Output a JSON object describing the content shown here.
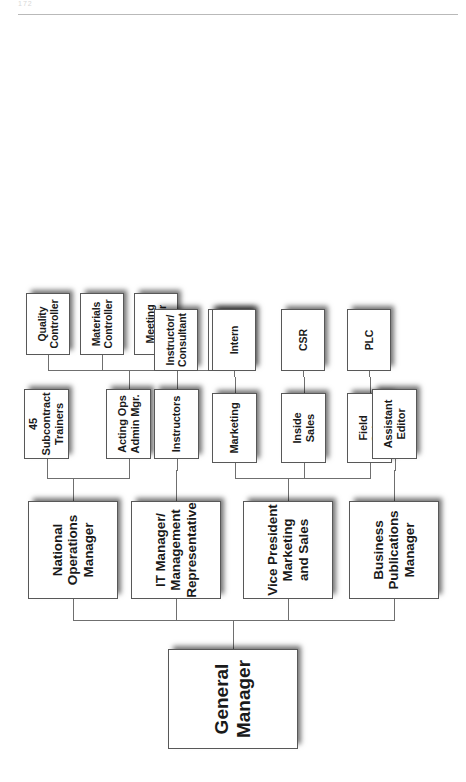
{
  "page": {
    "folio": "172",
    "header_rule": true
  },
  "chart": {
    "orientation": "rotated-90-ccw",
    "root": {
      "id": "general-manager",
      "label": "General Manager"
    },
    "level2": [
      {
        "id": "national-operations-manager",
        "label": "National\nOperations\nManager"
      },
      {
        "id": "it-manager-management-representative",
        "label": "IT Manager/\nManagement\nRepresentative"
      },
      {
        "id": "vice-president-marketing-and-sales",
        "label": "Vice President\nMarketing\nand Sales"
      },
      {
        "id": "business-publications-manager",
        "label": "Business\nPublications\nManager"
      }
    ],
    "level3": [
      {
        "id": "subcontract-trainers",
        "label": "45\nSubcontract\nTrainers",
        "parent": "national-operations-manager"
      },
      {
        "id": "acting-ops-admin-mgr",
        "label": "Acting Ops\nAdmin Mgr.",
        "parent": "national-operations-manager"
      },
      {
        "id": "instructors",
        "label": "Instructors",
        "parent": "it-manager-management-representative"
      },
      {
        "id": "marketing",
        "label": "Marketing",
        "parent": "vice-president-marketing-and-sales"
      },
      {
        "id": "inside-sales",
        "label": "Inside\nSales",
        "parent": "vice-president-marketing-and-sales"
      },
      {
        "id": "field-sales",
        "label": "Field\nSales",
        "parent": "vice-president-marketing-and-sales"
      },
      {
        "id": "assistant-editor",
        "label": "Assistant\nEditor",
        "parent": "business-publications-manager"
      }
    ],
    "level4": [
      {
        "id": "quality-controller",
        "label": "Quality\nController",
        "parent": "acting-ops-admin-mgr"
      },
      {
        "id": "materials-controller",
        "label": "Materials\nController",
        "parent": "acting-ops-admin-mgr"
      },
      {
        "id": "meeting-planner",
        "label": "Meeting\nPlanner",
        "parent": "acting-ops-admin-mgr"
      },
      {
        "id": "instructor-consultant-1",
        "label": "Instructor/\nConsultant",
        "parent": "instructors"
      },
      {
        "id": "instructor-consultant-2",
        "label": "Instructor/\nConsultant",
        "parent": "instructors"
      },
      {
        "id": "intern",
        "label": "Intern",
        "parent": "marketing"
      },
      {
        "id": "csr",
        "label": "CSR",
        "parent": "inside-sales"
      },
      {
        "id": "plc",
        "label": "PLC",
        "parent": "field-sales"
      }
    ],
    "colors": {
      "box_fill": "#ffffff",
      "box_border": "#585858",
      "connector": "#6f6f6f",
      "text": "#1a1a1a",
      "shadow": "rgba(0,0,0,0.55)"
    }
  }
}
